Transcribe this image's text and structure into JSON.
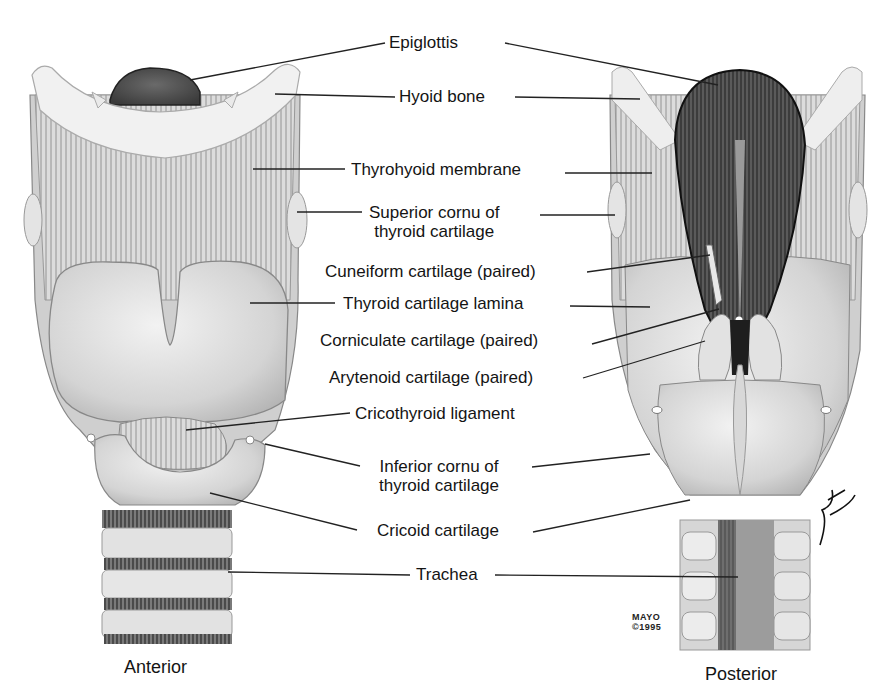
{
  "diagram": {
    "views": [
      {
        "id": "anterior",
        "title": "Anterior"
      },
      {
        "id": "posterior",
        "title": "Posterior"
      }
    ],
    "labels": [
      {
        "id": "epiglottis",
        "lines": [
          "Epiglottis"
        ]
      },
      {
        "id": "hyoid-bone",
        "lines": [
          "Hyoid bone"
        ]
      },
      {
        "id": "thyrohyoid-membrane",
        "lines": [
          "Thyrohyoid membrane"
        ]
      },
      {
        "id": "superior-cornu",
        "lines": [
          "Superior cornu of",
          "thyroid cartilage"
        ]
      },
      {
        "id": "cuneiform-cartilage",
        "lines": [
          "Cuneiform cartilage (paired)"
        ]
      },
      {
        "id": "thyroid-cartilage-lamina",
        "lines": [
          "Thyroid cartilage lamina"
        ]
      },
      {
        "id": "corniculate-cartilage",
        "lines": [
          "Corniculate cartilage (paired)"
        ]
      },
      {
        "id": "arytenoid-cartilage",
        "lines": [
          "Arytenoid cartilage (paired)"
        ]
      },
      {
        "id": "cricothyroid-ligament",
        "lines": [
          "Cricothyroid ligament"
        ]
      },
      {
        "id": "inferior-cornu",
        "lines": [
          "Inferior cornu of",
          "thyroid cartilage"
        ]
      },
      {
        "id": "cricoid-cartilage",
        "lines": [
          "Cricoid cartilage"
        ]
      },
      {
        "id": "trachea",
        "lines": [
          "Trachea"
        ]
      }
    ],
    "credit": {
      "line1": "MAYO",
      "line2": "©1995"
    },
    "signature": "JWH",
    "colors": {
      "background": "#ffffff",
      "ink": "#141414",
      "cartilage_light": "#e6e6e6",
      "cartilage_mid": "#c9c9c9",
      "membrane": "#d2d2d2",
      "dark_interior": "#4a4a4a",
      "leader_line": "#222222"
    }
  }
}
